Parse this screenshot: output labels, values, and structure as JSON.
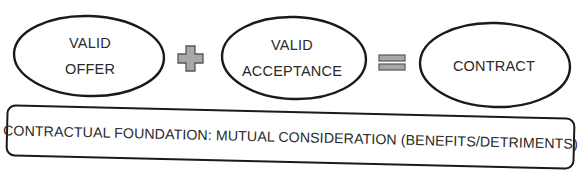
{
  "diagram": {
    "type": "equation-flow",
    "nodes": [
      {
        "id": "offer",
        "shape": "ellipse",
        "lines": [
          "VALID",
          "OFFER"
        ]
      },
      {
        "id": "acceptance",
        "shape": "ellipse",
        "lines": [
          "VALID",
          "ACCEPTANCE"
        ]
      },
      {
        "id": "contract",
        "shape": "ellipse",
        "lines": [
          "CONTRACT"
        ]
      }
    ],
    "operators": [
      {
        "id": "plus",
        "symbol": "+",
        "between": [
          "offer",
          "acceptance"
        ]
      },
      {
        "id": "equals",
        "symbol": "=",
        "between": [
          "acceptance",
          "contract"
        ]
      }
    ],
    "foundation": {
      "shape": "rounded-rectangle",
      "text": "CONTRACTUAL FOUNDATION: MUTUAL CONSIDERATION (BENEFITS/DETRIMENTS)"
    },
    "colors": {
      "outline": "#1a1a1a",
      "text": "#2a2a2a",
      "operator_fill": "#a8a8a8",
      "operator_stroke": "#555555",
      "background": "#ffffff"
    }
  }
}
